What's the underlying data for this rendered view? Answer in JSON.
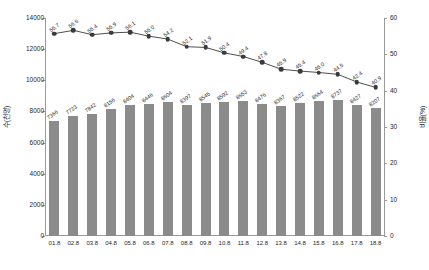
{
  "chart_data": {
    "type": "bar",
    "title": "",
    "subtitle": "",
    "xlabel": "",
    "ylabel": "수(천명)",
    "y2label": "비율(%)",
    "ylim": [
      0,
      14000
    ],
    "y2lim": [
      0,
      60
    ],
    "grid": false,
    "legend_position": "none",
    "categories": [
      "01.8",
      "02.8",
      "03.8",
      "04.8",
      "05.8",
      "06.8",
      "07.8",
      "08.8",
      "09.8",
      "10.8",
      "11.8",
      "12.8",
      "13.8",
      "14.8",
      "15.8",
      "16.8",
      "17.8",
      "18.8"
    ],
    "y_ticks": [
      "0",
      "2000",
      "4000",
      "6000",
      "8000",
      "10000",
      "12000",
      "14000"
    ],
    "y2_ticks": [
      "0",
      "10",
      "20",
      "30",
      "40",
      "50",
      "60"
    ],
    "series": [
      {
        "name": "수(천명)",
        "type": "bar",
        "axis": "left",
        "color": "#8b8b8b",
        "values": [
          7366,
          7723,
          7842,
          8156,
          8404,
          8446,
          8604,
          8397,
          8545,
          8592,
          8653,
          8476,
          8367,
          8522,
          8664,
          8737,
          8427,
          8207
        ],
        "labels": [
          "7366",
          "7723",
          "7842",
          "8156",
          "8404",
          "8446",
          "8604",
          "8397",
          "8545",
          "8592",
          "8653",
          "8476",
          "8367",
          "8522",
          "8664",
          "8737",
          "8427",
          "8207"
        ]
      },
      {
        "name": "비율(%)",
        "type": "line",
        "axis": "right",
        "color": "#3a3a3a",
        "values": [
          55.7,
          56.6,
          55.4,
          55.9,
          56.1,
          55.0,
          54.2,
          52.1,
          51.9,
          50.4,
          49.4,
          47.8,
          45.9,
          45.4,
          45.0,
          44.5,
          42.4,
          40.9
        ],
        "labels": [
          "55.7",
          "56.6",
          "55.4",
          "55.9",
          "56.1",
          "55.0",
          "54.2",
          "52.1",
          "51.9",
          "50.4",
          "49.4",
          "47.8",
          "45.9",
          "45.4",
          "45.0",
          "44.5",
          "42.4",
          "40.9"
        ]
      }
    ]
  }
}
